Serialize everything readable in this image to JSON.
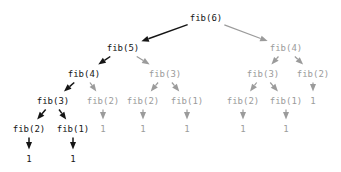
{
  "figure": {
    "colors": {
      "active": "#151515",
      "faded": "#9b9b9b",
      "background": "#ffffff"
    }
  },
  "nodes": [
    {
      "id": "n0",
      "label": "fib(6)",
      "x": 206,
      "y": 18,
      "state": "active"
    },
    {
      "id": "n1",
      "label": "fib(5)",
      "x": 123,
      "y": 48,
      "state": "active"
    },
    {
      "id": "n2",
      "label": "fib(4)",
      "x": 286,
      "y": 48,
      "state": "faded"
    },
    {
      "id": "n3",
      "label": "fib(4)",
      "x": 84,
      "y": 74,
      "state": "active"
    },
    {
      "id": "n4",
      "label": "fib(3)",
      "x": 165,
      "y": 74,
      "state": "faded"
    },
    {
      "id": "n5",
      "label": "fib(3)",
      "x": 263,
      "y": 74,
      "state": "faded"
    },
    {
      "id": "n6",
      "label": "fib(2)",
      "x": 313,
      "y": 74,
      "state": "faded"
    },
    {
      "id": "n7",
      "label": "fib(3)",
      "x": 53,
      "y": 101,
      "state": "active"
    },
    {
      "id": "n8",
      "label": "fib(2)",
      "x": 103,
      "y": 101,
      "state": "faded"
    },
    {
      "id": "n9",
      "label": "fib(2)",
      "x": 143,
      "y": 101,
      "state": "faded"
    },
    {
      "id": "n10",
      "label": "fib(1)",
      "x": 187,
      "y": 101,
      "state": "faded"
    },
    {
      "id": "n11",
      "label": "fib(2)",
      "x": 243,
      "y": 101,
      "state": "faded"
    },
    {
      "id": "n12",
      "label": "fib(1)",
      "x": 286,
      "y": 101,
      "state": "faded"
    },
    {
      "id": "n13",
      "label": "1",
      "x": 313,
      "y": 101,
      "state": "faded"
    },
    {
      "id": "n14",
      "label": "fib(2)",
      "x": 29,
      "y": 129,
      "state": "active"
    },
    {
      "id": "n15",
      "label": "fib(1)",
      "x": 73,
      "y": 129,
      "state": "active"
    },
    {
      "id": "n16",
      "label": "1",
      "x": 103,
      "y": 129,
      "state": "faded"
    },
    {
      "id": "n17",
      "label": "1",
      "x": 143,
      "y": 129,
      "state": "faded"
    },
    {
      "id": "n18",
      "label": "1",
      "x": 187,
      "y": 129,
      "state": "faded"
    },
    {
      "id": "n19",
      "label": "1",
      "x": 243,
      "y": 129,
      "state": "faded"
    },
    {
      "id": "n20",
      "label": "1",
      "x": 286,
      "y": 129,
      "state": "faded"
    },
    {
      "id": "n21",
      "label": "1",
      "x": 29,
      "y": 159,
      "state": "active"
    },
    {
      "id": "n22",
      "label": "1",
      "x": 73,
      "y": 159,
      "state": "active"
    }
  ],
  "edges": [
    {
      "from": "n0",
      "to": "n1",
      "state": "active"
    },
    {
      "from": "n0",
      "to": "n2",
      "state": "faded"
    },
    {
      "from": "n1",
      "to": "n3",
      "state": "active"
    },
    {
      "from": "n1",
      "to": "n4",
      "state": "faded"
    },
    {
      "from": "n2",
      "to": "n5",
      "state": "faded"
    },
    {
      "from": "n2",
      "to": "n6",
      "state": "faded"
    },
    {
      "from": "n3",
      "to": "n7",
      "state": "active"
    },
    {
      "from": "n3",
      "to": "n8",
      "state": "faded"
    },
    {
      "from": "n4",
      "to": "n9",
      "state": "faded"
    },
    {
      "from": "n4",
      "to": "n10",
      "state": "faded"
    },
    {
      "from": "n5",
      "to": "n11",
      "state": "faded"
    },
    {
      "from": "n5",
      "to": "n12",
      "state": "faded"
    },
    {
      "from": "n6",
      "to": "n13",
      "state": "faded"
    },
    {
      "from": "n7",
      "to": "n14",
      "state": "active"
    },
    {
      "from": "n7",
      "to": "n15",
      "state": "active"
    },
    {
      "from": "n8",
      "to": "n16",
      "state": "faded"
    },
    {
      "from": "n9",
      "to": "n17",
      "state": "faded"
    },
    {
      "from": "n10",
      "to": "n18",
      "state": "faded"
    },
    {
      "from": "n11",
      "to": "n19",
      "state": "faded"
    },
    {
      "from": "n12",
      "to": "n20",
      "state": "faded"
    },
    {
      "from": "n14",
      "to": "n21",
      "state": "active"
    },
    {
      "from": "n15",
      "to": "n22",
      "state": "active"
    }
  ]
}
